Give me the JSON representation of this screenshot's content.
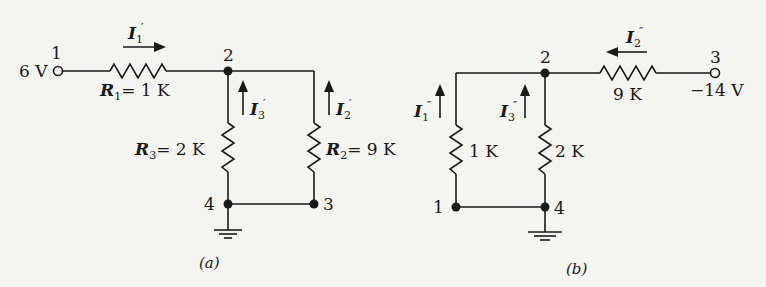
{
  "circuit_a": {
    "caption": "(a)",
    "source": "6 V",
    "nodes": [
      "1",
      "2",
      "3",
      "4"
    ],
    "R1": {
      "sym": "R",
      "sub": "1",
      "val": "= 1 K"
    },
    "R2": {
      "sym": "R",
      "sub": "2",
      "val": "= 9 K"
    },
    "R3": {
      "sym": "R",
      "sub": "3",
      "val": "= 2 K"
    },
    "currents": {
      "I1": {
        "sym": "I",
        "sub": "1",
        "prime": "′"
      },
      "I2": {
        "sym": "I",
        "sub": "2",
        "prime": "′"
      },
      "I3": {
        "sym": "I",
        "sub": "3",
        "prime": "′"
      }
    }
  },
  "circuit_b": {
    "caption": "(b)",
    "source": "−14 V",
    "nodes": [
      "1",
      "2",
      "3",
      "4"
    ],
    "R_series": "9 K",
    "R_left": "1 K",
    "R_right": "2 K",
    "currents": {
      "I1": {
        "sym": "I",
        "sub": "1",
        "prime": "″"
      },
      "I2": {
        "sym": "I",
        "sub": "2",
        "prime": "″"
      },
      "I3": {
        "sym": "I",
        "sub": "3",
        "prime": "″"
      }
    }
  },
  "colors": {
    "ink": "#1a1a1a",
    "paper": "#f4f4f1"
  }
}
